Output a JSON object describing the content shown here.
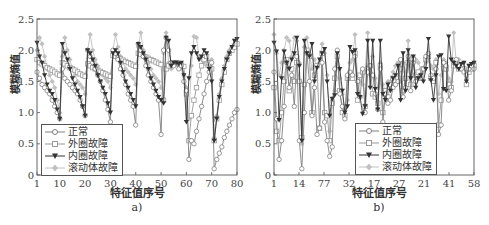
{
  "chart_data": [
    {
      "id": "a",
      "type": "line",
      "caption": "a)",
      "xlabel": "特征值序号",
      "ylabel": "模糊熵值",
      "xlim": [
        1,
        80
      ],
      "ylim": [
        0,
        2.5
      ],
      "xticks": [
        "1",
        "10",
        "20",
        "30",
        "40",
        "50",
        "60",
        "70",
        "80"
      ],
      "yticks": [
        "0",
        "0.5",
        "1.0",
        "1.5",
        "2.0",
        "2.5"
      ],
      "grid": false,
      "legend_position": "lower-left",
      "series": [
        {
          "name": "正常",
          "marker": "circle",
          "color": "#808080",
          "values": [
            1.65,
            1.55,
            1.45,
            1.4,
            1.35,
            1.3,
            1.2,
            1.1,
            1.0,
            0.9,
            1.7,
            1.55,
            1.5,
            1.45,
            1.4,
            1.35,
            1.3,
            1.2,
            1.1,
            0.95,
            2.0,
            1.9,
            1.8,
            1.7,
            1.6,
            1.5,
            1.35,
            1.2,
            1.05,
            0.85,
            2.0,
            1.95,
            1.85,
            1.7,
            1.6,
            1.45,
            1.3,
            1.2,
            1.1,
            0.8,
            2.1,
            2.0,
            1.9,
            1.75,
            1.6,
            1.5,
            1.4,
            1.3,
            1.2,
            0.65,
            2.0,
            2.2,
            2.0,
            1.8,
            1.75,
            1.8,
            1.7,
            1.75,
            1.5,
            1.35,
            0.25,
            0.55,
            0.5,
            0.7,
            0.9,
            1.1,
            1.3,
            1.5,
            1.65,
            1.8,
            0.1,
            0.25,
            0.35,
            0.45,
            0.6,
            0.7,
            0.8,
            0.9,
            1.0,
            1.05
          ]
        },
        {
          "name": "外圈故障",
          "marker": "square",
          "color": "#999999",
          "values": [
            1.85,
            1.8,
            1.78,
            1.75,
            1.72,
            1.7,
            1.68,
            1.65,
            1.62,
            1.6,
            1.8,
            1.78,
            1.75,
            1.72,
            1.7,
            1.68,
            1.65,
            1.62,
            1.6,
            1.58,
            1.78,
            1.75,
            1.72,
            1.7,
            1.68,
            1.66,
            1.64,
            1.62,
            1.6,
            1.58,
            1.92,
            1.9,
            1.88,
            1.86,
            1.84,
            1.82,
            1.8,
            1.78,
            1.76,
            1.74,
            1.95,
            1.93,
            1.91,
            1.89,
            1.87,
            1.85,
            1.83,
            1.81,
            1.79,
            1.77,
            1.2,
            1.7,
            1.75,
            1.78,
            1.8,
            1.8,
            1.78,
            1.76,
            1.74,
            1.3,
            0.55,
            0.95,
            1.2,
            1.4,
            1.6,
            1.75,
            1.85,
            1.9,
            1.8,
            1.7,
            0.55,
            0.9,
            1.2,
            1.45,
            1.65,
            1.85,
            1.95,
            2.0,
            2.05,
            2.1
          ]
        },
        {
          "name": "内圈故障",
          "marker": "triangle-down",
          "color": "#333333",
          "values": [
            2.12,
            1.9,
            1.8,
            1.6,
            1.45,
            1.35,
            1.3,
            1.2,
            1.05,
            0.9,
            2.1,
            1.95,
            1.85,
            1.7,
            1.55,
            1.45,
            1.35,
            1.25,
            1.1,
            0.95,
            2.0,
            1.95,
            1.85,
            1.75,
            1.6,
            1.5,
            1.4,
            1.3,
            1.15,
            1.0,
            1.95,
            2.0,
            1.95,
            1.8,
            1.65,
            1.5,
            1.4,
            1.3,
            1.2,
            1.1,
            2.1,
            2.05,
            1.95,
            1.85,
            1.7,
            1.55,
            1.45,
            1.35,
            1.25,
            1.2,
            1.15,
            2.2,
            2.15,
            1.75,
            1.8,
            1.8,
            1.78,
            1.8,
            1.6,
            0.85,
            1.55,
            1.95,
            2.05,
            1.95,
            1.85,
            1.9,
            2.0,
            1.95,
            1.7,
            1.5,
            0.55,
            0.9,
            1.25,
            1.5,
            1.7,
            1.85,
            1.95,
            2.05,
            2.15,
            2.18
          ]
        },
        {
          "name": "滚动体故障",
          "marker": "diamond",
          "color": "#c0c0c0",
          "values": [
            2.0,
            2.2,
            2.1,
            1.9,
            1.7,
            1.6,
            1.5,
            1.4,
            1.2,
            1.0,
            1.9,
            2.2,
            2.0,
            1.85,
            1.7,
            1.6,
            1.5,
            1.45,
            1.4,
            1.3,
            2.0,
            2.25,
            2.0,
            1.85,
            1.75,
            1.65,
            1.6,
            1.55,
            1.5,
            1.4,
            2.0,
            2.25,
            2.05,
            1.9,
            1.8,
            1.7,
            1.65,
            1.6,
            1.55,
            1.45,
            2.05,
            2.28,
            2.0,
            1.9,
            1.8,
            1.7,
            1.6,
            1.55,
            1.5,
            1.4,
            1.95,
            2.28,
            1.8,
            1.7,
            1.75,
            1.78,
            1.8,
            1.76,
            1.6,
            1.4,
            0.9,
            1.75,
            2.22,
            2.2,
            1.9,
            1.85,
            1.8,
            1.75,
            1.8,
            1.85,
            0.6,
            0.95,
            1.3,
            1.55,
            1.75,
            1.9,
            2.0,
            2.05,
            2.1,
            2.12
          ]
        }
      ]
    },
    {
      "id": "b",
      "type": "line",
      "caption": "b)",
      "xlabel": "特征值序号",
      "ylabel": "模糊熵值",
      "xlim": [
        1,
        80
      ],
      "ylim": [
        0,
        2.5
      ],
      "xticks": [
        "1",
        "14",
        "77",
        "32",
        "17",
        "27",
        "21",
        "41",
        "58"
      ],
      "yticks": [
        "0",
        "0.5",
        "1.0",
        "1.5",
        "2.0",
        "2.5"
      ],
      "grid": false,
      "legend_position": "lower-right",
      "series": [
        {
          "name": "正常",
          "marker": "circle",
          "color": "#808080",
          "values": [
            1.65,
            0.9,
            0.25,
            0.55,
            1.1,
            1.8,
            1.4,
            1.6,
            1.1,
            1.9,
            0.55,
            0.1,
            1.0,
            1.95,
            1.5,
            0.95,
            1.4,
            0.65,
            0.75,
            1.8,
            0.85,
            0.55,
            0.3,
            0.45,
            1.7,
            2.0,
            1.3,
            1.1,
            0.9,
            1.6,
            1.65,
            1.6,
            1.9,
            1.5,
            1.25,
            1.7,
            1.0,
            1.65,
            1.75,
            1.6,
            1.3,
            1.05,
            1.7,
            0.85,
            1.3,
            1.15,
            1.2,
            1.4,
            1.45,
            1.5,
            1.85,
            1.25,
            1.4,
            1.9,
            1.35,
            1.8,
            1.5,
            1.55,
            1.6,
            1.7,
            1.9,
            1.95,
            1.6,
            1.55,
            1.7,
            0.65,
            0.8,
            1.8,
            1.75,
            1.2,
            1.35,
            1.8,
            1.85,
            1.75,
            1.7,
            1.65,
            1.6,
            1.7,
            1.75,
            1.7
          ]
        },
        {
          "name": "外圈故障",
          "marker": "square",
          "color": "#999999",
          "values": [
            1.4,
            0.7,
            0.55,
            1.0,
            1.5,
            1.85,
            1.35,
            1.7,
            1.5,
            1.8,
            1.5,
            0.6,
            1.45,
            2.0,
            1.9,
            1.0,
            1.6,
            1.75,
            0.75,
            1.95,
            1.0,
            0.95,
            0.55,
            1.15,
            1.55,
            1.9,
            1.35,
            1.0,
            0.95,
            1.55,
            1.6,
            1.55,
            1.95,
            1.2,
            1.6,
            1.65,
            1.1,
            1.7,
            1.75,
            1.3,
            1.25,
            1.15,
            1.75,
            1.0,
            1.35,
            1.25,
            1.45,
            1.55,
            1.5,
            1.55,
            1.7,
            1.35,
            1.55,
            1.8,
            1.45,
            1.85,
            1.6,
            1.65,
            1.55,
            1.7,
            1.85,
            1.9,
            1.55,
            1.5,
            1.8,
            0.8,
            1.2,
            1.7,
            1.7,
            1.45,
            1.4,
            1.75,
            1.8,
            1.7,
            1.75,
            1.7,
            1.45,
            1.65,
            1.7,
            1.75
          ]
        },
        {
          "name": "内圈故障",
          "marker": "triangle-down",
          "color": "#333333",
          "values": [
            2.12,
            1.98,
            0.88,
            1.55,
            1.98,
            1.8,
            1.7,
            1.85,
            1.95,
            2.2,
            1.75,
            0.55,
            2.15,
            1.95,
            1.9,
            2.1,
            1.5,
            1.72,
            1.85,
            1.95,
            2.02,
            1.5,
            0.95,
            1.22,
            1.28,
            1.95,
            1.7,
            1.35,
            1.0,
            1.1,
            2.05,
            1.97,
            2.0,
            1.3,
            1.25,
            0.98,
            1.1,
            2.15,
            1.4,
            2.15,
            1.38,
            1.05,
            2.15,
            1.3,
            1.2,
            1.45,
            1.35,
            1.55,
            1.6,
            1.75,
            1.2,
            1.95,
            1.35,
            2.0,
            1.55,
            1.9,
            1.4,
            1.55,
            1.6,
            1.5,
            1.7,
            2.18,
            1.52,
            1.2,
            1.6,
            1.9,
            1.92,
            1.38,
            1.35,
            2.22,
            1.85,
            1.8,
            1.75,
            1.7,
            1.78,
            1.8,
            1.5,
            1.75,
            1.78,
            1.8
          ]
        },
        {
          "name": "滚动体故障",
          "marker": "diamond",
          "color": "#c0c0c0",
          "values": [
            2.25,
            1.95,
            1.6,
            1.8,
            2.0,
            2.2,
            2.15,
            1.9,
            2.2,
            2.15,
            1.8,
            0.5,
            2.05,
            2.2,
            1.95,
            1.7,
            1.85,
            1.75,
            1.8,
            2.1,
            1.95,
            1.6,
            0.7,
            1.2,
            1.35,
            2.0,
            1.55,
            1.3,
            1.05,
            1.2,
            1.8,
            1.85,
            2.25,
            1.6,
            1.5,
            1.45,
            1.65,
            2.28,
            1.6,
            1.9,
            1.55,
            1.4,
            1.8,
            1.45,
            1.35,
            1.5,
            1.5,
            1.65,
            1.75,
            1.8,
            1.5,
            1.8,
            1.65,
            2.15,
            1.75,
            1.9,
            1.85,
            1.8,
            1.7,
            1.65,
            1.8,
            1.9,
            1.75,
            1.7,
            1.85,
            1.3,
            1.6,
            1.85,
            1.8,
            1.55,
            1.5,
            2.28,
            1.8,
            1.85,
            1.75,
            1.8,
            1.55,
            1.7,
            1.75,
            1.8
          ]
        }
      ]
    }
  ],
  "panels": {
    "a": {
      "caption": "a)",
      "xlabel": "特征值序号",
      "ylabel": "模糊熵值"
    },
    "b": {
      "caption": "b)",
      "xlabel": "特征值序号",
      "ylabel": "模糊熵值"
    }
  },
  "legend": {
    "items": [
      {
        "label": "正常",
        "marker": "circle",
        "color": "#808080"
      },
      {
        "label": "外圈故障",
        "marker": "square",
        "color": "#999999"
      },
      {
        "label": "内圈故障",
        "marker": "triangle-down",
        "color": "#333333"
      },
      {
        "label": "滚动体故障",
        "marker": "diamond",
        "color": "#c0c0c0"
      }
    ]
  }
}
